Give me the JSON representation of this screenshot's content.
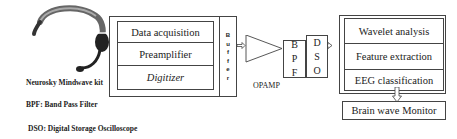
{
  "headset": {
    "label": "Neurosky Mindwave kit"
  },
  "acquisition_block": {
    "stages": [
      "Data acquisition",
      "Preamplifier",
      "Digitizer"
    ],
    "buffer_letters": [
      "B",
      "u",
      "f",
      "f",
      "e",
      "r"
    ]
  },
  "opamp": {
    "label": "OPAMP"
  },
  "bpf": {
    "letters": [
      "B",
      "P",
      "F"
    ]
  },
  "dso": {
    "letters": [
      "D",
      "S",
      "O"
    ]
  },
  "processing_block": {
    "stages": [
      "Wavelet analysis",
      "Feature extraction",
      "EEG classification"
    ]
  },
  "monitor": {
    "label": "Brain wave Monitor"
  },
  "legend": {
    "bpf": "BPF: Band Pass Filter",
    "dso": "DSO: Digital Storage Oscilloscope"
  },
  "colors": {
    "line": "#444444",
    "text": "#222222",
    "headset": "#555555"
  }
}
